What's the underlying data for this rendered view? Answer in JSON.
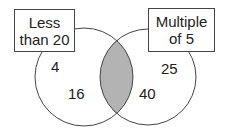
{
  "diagram": {
    "type": "venn",
    "sets": [
      {
        "label_line1": "Less",
        "label_line2": "than 20"
      },
      {
        "label_line1": "Multiple",
        "label_line2": "of 5"
      }
    ],
    "left_only": [
      "4",
      "16"
    ],
    "right_only": [
      "25",
      "40"
    ],
    "intersection": [],
    "colors": {
      "intersection_fill": "#b3b3b3",
      "stroke": "#444444"
    }
  }
}
